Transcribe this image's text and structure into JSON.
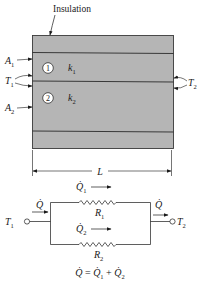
{
  "figure": {
    "insulation_label": "Insulation",
    "wall": {
      "fill_color": "#b5b5b5",
      "edge_color": "#3a3a3a",
      "layers": [
        {
          "number": "1",
          "conductivity": "k",
          "conductivity_sub": "1"
        },
        {
          "number": "2",
          "conductivity": "k",
          "conductivity_sub": "2"
        }
      ]
    },
    "left_labels": {
      "A1": {
        "base": "A",
        "sub": "1"
      },
      "T1": {
        "base": "T",
        "sub": "1"
      },
      "A2": {
        "base": "A",
        "sub": "2"
      }
    },
    "right_labels": {
      "T2": {
        "base": "T",
        "sub": "2"
      }
    },
    "length_label": "L"
  },
  "circuit": {
    "inlet_node": {
      "base": "T",
      "sub": "1"
    },
    "outlet_node": {
      "base": "T",
      "sub": "2"
    },
    "inlet_flow": "Q̇",
    "outlet_flow": "Q̇",
    "branches": [
      {
        "flow": "Q̇",
        "flow_sub": "1",
        "resistor": "R",
        "resistor_sub": "1"
      },
      {
        "flow": "Q̇",
        "flow_sub": "2",
        "resistor": "R",
        "resistor_sub": "2"
      }
    ],
    "equation": {
      "lhs": "Q̇",
      "eq": " = ",
      "t1": "Q̇",
      "t1_sub": "1",
      "plus": " + ",
      "t2": "Q̇",
      "t2_sub": "2"
    }
  }
}
